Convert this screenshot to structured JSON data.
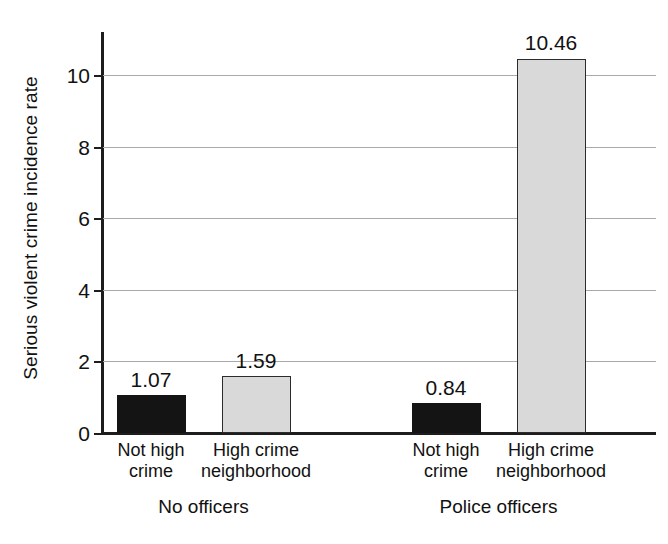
{
  "chart_data": {
    "type": "bar",
    "title": "",
    "xlabel": "",
    "ylabel": "Serious violent crime incidence rate",
    "ylim": [
      0,
      11.2
    ],
    "yticks": [
      0,
      2,
      4,
      6,
      8,
      10
    ],
    "ytick_labels": [
      "0",
      "2",
      "4",
      "6",
      "8",
      "10"
    ],
    "grid": true,
    "legend": "none",
    "group_labels": [
      "No officers",
      "Police officers"
    ],
    "categories": [
      "Not high crime",
      "High crime neighborhood"
    ],
    "series": [
      {
        "name": "Not high crime",
        "color": "#141414",
        "values": [
          1.07,
          0.84
        ]
      },
      {
        "name": "High crime neighborhood",
        "color": "#d9d9d9",
        "values": [
          1.59,
          10.46
        ]
      }
    ],
    "bars": [
      {
        "group": "No officers",
        "category": "Not high crime",
        "category_line1": "Not high",
        "category_line2": "crime",
        "value": 1.07,
        "value_label": "1.07",
        "fill": "dark"
      },
      {
        "group": "No officers",
        "category": "High crime neighborhood",
        "category_line1": "High crime",
        "category_line2": "neighborhood",
        "value": 1.59,
        "value_label": "1.59",
        "fill": "light"
      },
      {
        "group": "Police officers",
        "category": "Not high crime",
        "category_line1": "Not high",
        "category_line2": "crime",
        "value": 0.84,
        "value_label": "0.84",
        "fill": "dark"
      },
      {
        "group": "Police officers",
        "category": "High crime neighborhood",
        "category_line1": "High crime",
        "category_line2": "neighborhood",
        "value": 10.46,
        "value_label": "10.46",
        "fill": "light"
      }
    ]
  },
  "colors": {
    "dark_bar": "#141414",
    "light_bar": "#d9d9d9",
    "axis": "#1d1d1d",
    "gridline": "#a9a9a9",
    "background": "#ffffff"
  }
}
